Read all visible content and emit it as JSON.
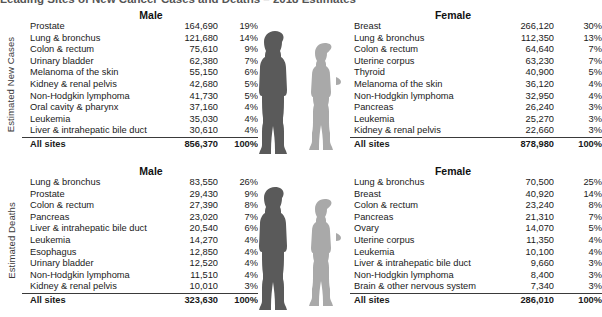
{
  "title": "Leading Sites of New Cancer Cases and Deaths – 2018 Estimates",
  "axis_labels": {
    "new_cases": "Estimated New Cases",
    "deaths": "Estimated Deaths"
  },
  "headers": {
    "male": "Male",
    "female": "Female"
  },
  "figures": {
    "male_color": "#5a5a5a",
    "female_color": "#a9a9a9",
    "male_name": "male-silhouette",
    "female_name": "female-silhouette"
  },
  "chart_data": {
    "type": "table",
    "title": "Leading Sites of New Cancer Cases and Deaths – 2018 Estimates",
    "columns": [
      "Site",
      "Estimated count",
      "Percent"
    ],
    "sections": [
      {
        "label": "Estimated New Cases",
        "panels": [
          {
            "sex": "Male",
            "rows": [
              {
                "site": "Prostate",
                "count": "164,690",
                "pct": "19%"
              },
              {
                "site": "Lung & bronchus",
                "count": "121,680",
                "pct": "14%"
              },
              {
                "site": "Colon & rectum",
                "count": "75,610",
                "pct": "9%"
              },
              {
                "site": "Urinary bladder",
                "count": "62,380",
                "pct": "7%"
              },
              {
                "site": "Melanoma of the skin",
                "count": "55,150",
                "pct": "6%"
              },
              {
                "site": "Kidney & renal pelvis",
                "count": "42,680",
                "pct": "5%"
              },
              {
                "site": "Non-Hodgkin lymphoma",
                "count": "41,730",
                "pct": "5%"
              },
              {
                "site": "Oral cavity & pharynx",
                "count": "37,160",
                "pct": "4%"
              },
              {
                "site": "Leukemia",
                "count": "35,030",
                "pct": "4%"
              },
              {
                "site": "Liver & intrahepatic bile duct",
                "count": "30,610",
                "pct": "4%"
              }
            ],
            "total": {
              "site": "All sites",
              "count": "856,370",
              "pct": "100%"
            }
          },
          {
            "sex": "Female",
            "rows": [
              {
                "site": "Breast",
                "count": "266,120",
                "pct": "30%"
              },
              {
                "site": "Lung & bronchus",
                "count": "112,350",
                "pct": "13%"
              },
              {
                "site": "Colon & rectum",
                "count": "64,640",
                "pct": "7%"
              },
              {
                "site": "Uterine corpus",
                "count": "63,230",
                "pct": "7%"
              },
              {
                "site": "Thyroid",
                "count": "40,900",
                "pct": "5%"
              },
              {
                "site": "Melanoma of the skin",
                "count": "36,120",
                "pct": "4%"
              },
              {
                "site": "Non-Hodgkin lymphoma",
                "count": "32,950",
                "pct": "4%"
              },
              {
                "site": "Pancreas",
                "count": "26,240",
                "pct": "3%"
              },
              {
                "site": "Leukemia",
                "count": "25,270",
                "pct": "3%"
              },
              {
                "site": "Kidney & renal pelvis",
                "count": "22,660",
                "pct": "3%"
              }
            ],
            "total": {
              "site": "All sites",
              "count": "878,980",
              "pct": "100%"
            }
          }
        ]
      },
      {
        "label": "Estimated Deaths",
        "panels": [
          {
            "sex": "Male",
            "rows": [
              {
                "site": "Lung & bronchus",
                "count": "83,550",
                "pct": "26%"
              },
              {
                "site": "Prostate",
                "count": "29,430",
                "pct": "9%"
              },
              {
                "site": "Colon & rectum",
                "count": "27,390",
                "pct": "8%"
              },
              {
                "site": "Pancreas",
                "count": "23,020",
                "pct": "7%"
              },
              {
                "site": "Liver & intrahepatic bile duct",
                "count": "20,540",
                "pct": "6%"
              },
              {
                "site": "Leukemia",
                "count": "14,270",
                "pct": "4%"
              },
              {
                "site": "Esophagus",
                "count": "12,850",
                "pct": "4%"
              },
              {
                "site": "Urinary bladder",
                "count": "12,520",
                "pct": "4%"
              },
              {
                "site": "Non-Hodgkin lymphoma",
                "count": "11,510",
                "pct": "4%"
              },
              {
                "site": "Kidney & renal pelvis",
                "count": "10,010",
                "pct": "3%"
              }
            ],
            "total": {
              "site": "All sites",
              "count": "323,630",
              "pct": "100%"
            }
          },
          {
            "sex": "Female",
            "rows": [
              {
                "site": "Lung & bronchus",
                "count": "70,500",
                "pct": "25%"
              },
              {
                "site": "Breast",
                "count": "40,920",
                "pct": "14%"
              },
              {
                "site": "Colon & rectum",
                "count": "23,240",
                "pct": "8%"
              },
              {
                "site": "Pancreas",
                "count": "21,310",
                "pct": "7%"
              },
              {
                "site": "Ovary",
                "count": "14,070",
                "pct": "5%"
              },
              {
                "site": "Uterine corpus",
                "count": "11,350",
                "pct": "4%"
              },
              {
                "site": "Leukemia",
                "count": "10,100",
                "pct": "4%"
              },
              {
                "site": "Liver & intrahepatic bile duct",
                "count": "9,660",
                "pct": "3%"
              },
              {
                "site": "Non-Hodgkin lymphoma",
                "count": "8,400",
                "pct": "3%"
              },
              {
                "site": "Brain & other nervous system",
                "count": "7,340",
                "pct": "3%"
              }
            ],
            "total": {
              "site": "All sites",
              "count": "286,010",
              "pct": "100%"
            }
          }
        ]
      }
    ]
  }
}
